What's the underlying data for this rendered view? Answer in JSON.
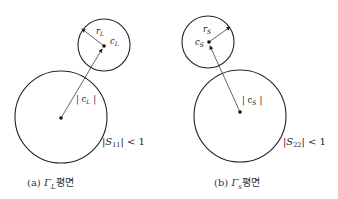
{
  "diagrams": [
    {
      "id": "a",
      "caption_prefix": "(a)",
      "caption_symbol": "Γ",
      "caption_sub": "L",
      "caption_suffix": "평면",
      "small_circle": {
        "center_label": "c",
        "center_sub": "L",
        "radius_label": "r",
        "radius_sub": "L"
      },
      "big_circle": {
        "distance_label": "| c",
        "distance_sub": "L",
        "distance_close": "|"
      },
      "condition": {
        "prefix": "|S",
        "sub": "11",
        "suffix": "| < 1"
      }
    },
    {
      "id": "b",
      "caption_prefix": "(b)",
      "caption_symbol": "Γ",
      "caption_sub": "s",
      "caption_suffix": "평면",
      "small_circle": {
        "center_label": "c",
        "center_sub": "S",
        "radius_label": "r",
        "radius_sub": "S"
      },
      "big_circle": {
        "distance_label": "| c",
        "distance_sub": "S",
        "distance_close": "|"
      },
      "condition": {
        "prefix": "|S",
        "sub": "22",
        "suffix": "| < 1"
      }
    }
  ],
  "colors": {
    "stroke": "#222222",
    "text": "#333333",
    "background": "#ffffff"
  }
}
